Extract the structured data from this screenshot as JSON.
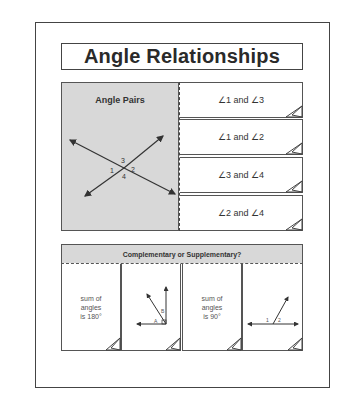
{
  "title": "Angle Relationships",
  "angle_pairs_panel": {
    "label": "Angle Pairs",
    "angle_labels": [
      "1",
      "2",
      "3",
      "4"
    ]
  },
  "flaps": [
    {
      "label": "∠1 and ∠3"
    },
    {
      "label": "∠1 and ∠2"
    },
    {
      "label": "∠3 and ∠4"
    },
    {
      "label": "∠2 and ∠4"
    }
  ],
  "bottom_section": {
    "header": "Complementary or Supplementary?",
    "flaps": [
      {
        "type": "text",
        "lines": [
          "sum of",
          "angles",
          "is 180°"
        ]
      },
      {
        "type": "figure",
        "figure": "complementary-angles",
        "angle_labels": [
          "A",
          "B"
        ]
      },
      {
        "type": "text",
        "lines": [
          "sum of",
          "angles",
          "is 90°"
        ]
      },
      {
        "type": "figure",
        "figure": "supplementary-angles",
        "angle_labels": [
          "1",
          "2"
        ]
      }
    ]
  },
  "colors": {
    "panel_gray": "#d8d8d8",
    "line": "#444444",
    "background": "#ffffff"
  }
}
